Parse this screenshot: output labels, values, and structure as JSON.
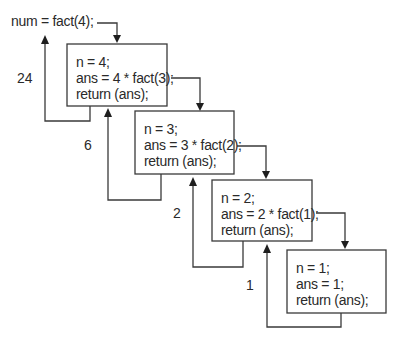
{
  "diagram": {
    "caller": {
      "text": "num = fact(4);"
    },
    "frames": [
      {
        "lines": [
          "n = 4;",
          "ans = 4 * fact(3);",
          "return (ans);"
        ],
        "return_value": "24"
      },
      {
        "lines": [
          "n = 3;",
          "ans = 3 * fact(2);",
          "return (ans);"
        ],
        "return_value": "6"
      },
      {
        "lines": [
          "n = 2;",
          "ans = 2 * fact(1);",
          "return (ans);"
        ],
        "return_value": "2"
      },
      {
        "lines": [
          "n = 1;",
          "ans = 1;",
          "return (ans);"
        ],
        "return_value": "1"
      }
    ],
    "colors": {
      "line": "#3a3a3a",
      "text": "#2a2a2a",
      "background": "#ffffff"
    }
  }
}
